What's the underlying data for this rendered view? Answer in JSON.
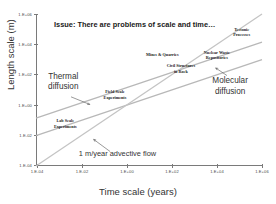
{
  "chart_data": {
    "type": "line",
    "title": "Issue: There are problems of scale and time…",
    "xlabel": "Time scale (years)",
    "ylabel": "Length scale (m)",
    "xlim": [
      -4,
      6
    ],
    "ylim": [
      -4,
      6
    ],
    "xscale": "log",
    "yscale": "log",
    "grid": false,
    "legend": "none (inline annotations)",
    "xticks": [
      "1.E-04",
      "1.E-02",
      "1.E+00",
      "1.E+02",
      "1.E+04",
      "1.E+06"
    ],
    "xtick_values": [
      -4,
      -2,
      0,
      2,
      4,
      6
    ],
    "yticks": [
      "1.E-04",
      "1.E-02",
      "1.E+00",
      "1.E+02",
      "1.E+04",
      "1.E+06"
    ],
    "ytick_values": [
      -4,
      -2,
      0,
      2,
      4,
      6
    ],
    "series": [
      {
        "name": "Thermal diffusion",
        "x": [
          -4,
          6
        ],
        "y": [
          -0.85,
          4.15
        ],
        "color": "#b8b8b8",
        "note": "upper line, slope 1/2 in log-log space"
      },
      {
        "name": "Molecular diffusion",
        "x": [
          -4,
          6
        ],
        "y": [
          -2.0,
          3.0
        ],
        "color": "#b8b8b8",
        "note": "middle line, slope 1/2 in log-log space"
      },
      {
        "name": "1 m/year advective flow",
        "x": [
          -4,
          6
        ],
        "y": [
          -4.0,
          6.0
        ],
        "color": "#c4c4c4",
        "note": "lower line, slope 1 in log-log space"
      }
    ],
    "annotations": [
      {
        "label": "Tectonic Processes",
        "text_lines": [
          "Tectonic",
          "Processes"
        ],
        "x": 5.1,
        "y": 4.8,
        "style": "small"
      },
      {
        "label": "Mines & Quarries",
        "text_lines": [
          "Mines & Quarries"
        ],
        "x": 1.6,
        "y": 3.3,
        "style": "small"
      },
      {
        "label": "Nuclear Waste Repositories",
        "text_lines": [
          "Nuclear Waste",
          "Repositories"
        ],
        "x": 4.0,
        "y": 3.3,
        "style": "small"
      },
      {
        "label": "Civil Structures in Rock",
        "text_lines": [
          "Civil Structures",
          "in Rock"
        ],
        "x": 2.4,
        "y": 2.4,
        "style": "small"
      },
      {
        "label": "Field Scale Experiments",
        "text_lines": [
          "Field Scale",
          "Experiments"
        ],
        "x": -0.5,
        "y": 0.7,
        "style": "small"
      },
      {
        "label": "Lab Scale Experiments",
        "text_lines": [
          "Lab Scale",
          "Experiments"
        ],
        "x": -2.7,
        "y": -1.2,
        "style": "small"
      },
      {
        "label": "Thermal diffusion",
        "text_lines": [
          "Thermal",
          "diffusion"
        ],
        "x": -2.8,
        "y": 1.5,
        "style": "big"
      },
      {
        "label": "Molecular diffusion",
        "text_lines": [
          "Molecular",
          "diffusion"
        ],
        "x": 4.6,
        "y": 1.2,
        "style": "big"
      },
      {
        "label": "1 m/year advective flow",
        "text_lines": [
          "1 m/year advective flow"
        ],
        "x": -0.4,
        "y": -3.2,
        "style": "flow"
      }
    ],
    "leader_lines": [
      {
        "label": "thermal-diffusion-leader",
        "from_x": -2.45,
        "from_y": 0.55,
        "to_x": -1.62,
        "to_y": 0.05
      },
      {
        "label": "molecular-diffusion-leader",
        "from_x": 4.45,
        "from_y": 1.95,
        "to_x": 3.95,
        "to_y": 2.45
      },
      {
        "label": "advective-flow-leader",
        "from_x": -0.72,
        "from_y": -3.05,
        "to_x": -1.45,
        "to_y": -2.25
      }
    ]
  }
}
